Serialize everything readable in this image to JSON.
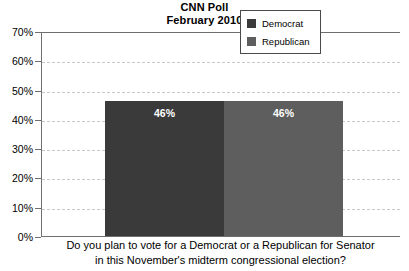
{
  "chart_data": {
    "type": "bar",
    "title": "CNN Poll",
    "subtitle": "February 2010",
    "categories": [
      "Democrat",
      "Republican"
    ],
    "values": [
      46,
      46
    ],
    "value_labels": [
      "46%",
      "46%"
    ],
    "xlabel": "",
    "ylabel": "",
    "ylim": [
      0,
      70
    ],
    "ytick_labels": [
      "0%",
      "10%",
      "20%",
      "30%",
      "40%",
      "50%",
      "60%",
      "70%"
    ],
    "ytick_values": [
      0,
      10,
      20,
      30,
      40,
      50,
      60,
      70
    ],
    "grid": true,
    "grid_style": "dashed",
    "legend_position": "top-right",
    "legend": [
      {
        "label": "Democrat",
        "color": "#3a3a3a"
      },
      {
        "label": "Republican",
        "color": "#5e5e5e"
      }
    ],
    "caption_lines": [
      "Do you plan to vote for a Democrat or a Republican for Senator",
      "in this November's midterm congressional election?"
    ],
    "colors": {
      "democrat": "#3a3a3a",
      "republican": "#5e5e5e",
      "axis": "#6f6f6f",
      "grid": "#c8c8c8",
      "background": "#ffffff",
      "text": "#000000"
    }
  }
}
